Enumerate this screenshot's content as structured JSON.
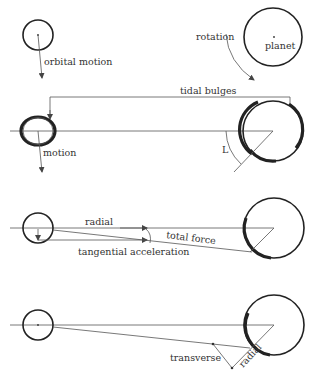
{
  "diagram": {
    "panels": [
      {
        "id": "panel-1",
        "labels": {
          "orbital_motion": "orbital motion",
          "rotation": "rotation",
          "planet": "planet"
        }
      },
      {
        "id": "panel-2",
        "labels": {
          "tidal_bulges": "tidal bulges",
          "motion": "motion",
          "angle": "L"
        }
      },
      {
        "id": "panel-3",
        "labels": {
          "radial": "radial",
          "total_force": "total force",
          "tangential_acceleration": "tangential acceleration"
        }
      },
      {
        "id": "panel-4",
        "labels": {
          "transverse": "transverse",
          "radial": "radial"
        }
      }
    ],
    "colors": {
      "ink": "#222222",
      "line": "#555555",
      "background": "#ffffff"
    }
  }
}
